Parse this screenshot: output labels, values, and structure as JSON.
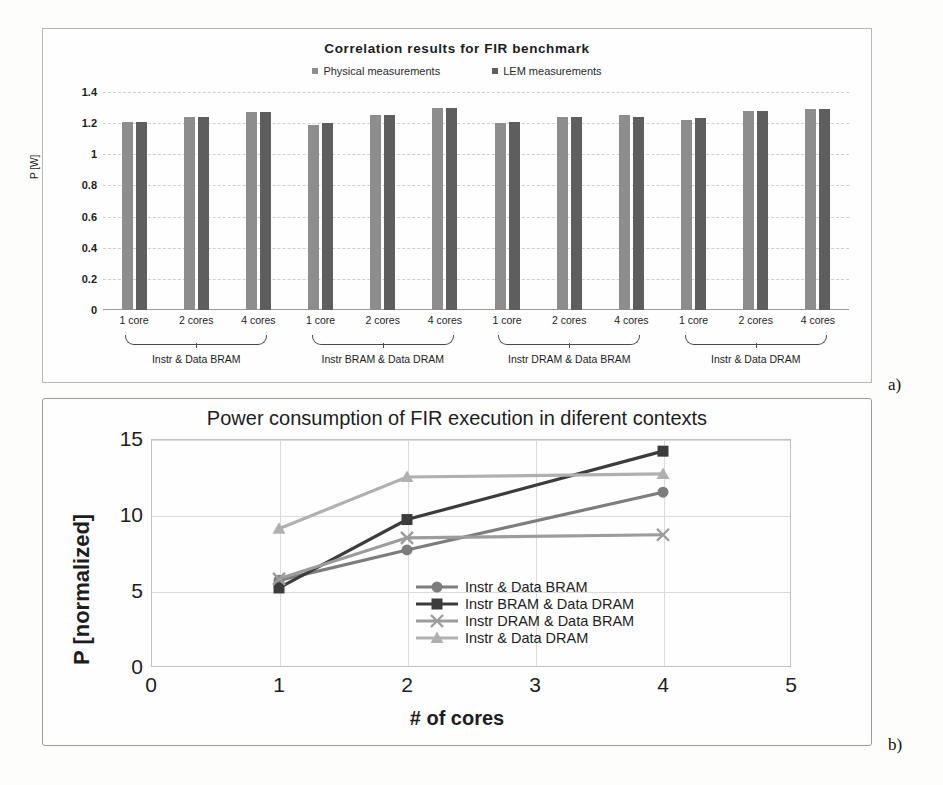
{
  "panel_a": {
    "tag": "a)",
    "chart_data": {
      "type": "bar",
      "title": "Correlation results for FIR benchmark",
      "xlabel": "",
      "ylabel": "P [W]",
      "ylim": [
        0,
        1.4
      ],
      "yticks": [
        "0",
        "0.2",
        "0.4",
        "0.6",
        "0.8",
        "1",
        "1.2",
        "1.4"
      ],
      "grid": true,
      "legend_position": "top-center",
      "legend": [
        {
          "name": "Physical measurements",
          "color": "#8d8d8d"
        },
        {
          "name": "LEM measurements",
          "color": "#5e5e5e"
        }
      ],
      "categories": [
        "1 core",
        "2 cores",
        "4 cores"
      ],
      "groups": [
        {
          "label": "Instr & Data BRAM",
          "clusters": [
            {
              "category": "1 core",
              "values": [
                1.21,
                1.21
              ]
            },
            {
              "category": "2 cores",
              "values": [
                1.24,
                1.24
              ]
            },
            {
              "category": "4 cores",
              "values": [
                1.27,
                1.27
              ]
            }
          ]
        },
        {
          "label": "Instr BRAM & Data DRAM",
          "clusters": [
            {
              "category": "1 core",
              "values": [
                1.19,
                1.2
              ]
            },
            {
              "category": "2 cores",
              "values": [
                1.25,
                1.25
              ]
            },
            {
              "category": "4 cores",
              "values": [
                1.3,
                1.3
              ]
            }
          ]
        },
        {
          "label": "Instr DRAM & Data BRAM",
          "clusters": [
            {
              "category": "1 core",
              "values": [
                1.2,
                1.21
              ]
            },
            {
              "category": "2 cores",
              "values": [
                1.24,
                1.24
              ]
            },
            {
              "category": "4 cores",
              "values": [
                1.25,
                1.24
              ]
            }
          ]
        },
        {
          "label": "Instr & Data DRAM",
          "clusters": [
            {
              "category": "1 core",
              "values": [
                1.22,
                1.23
              ]
            },
            {
              "category": "2 cores",
              "values": [
                1.28,
                1.28
              ]
            },
            {
              "category": "4 cores",
              "values": [
                1.29,
                1.29
              ]
            }
          ]
        }
      ]
    }
  },
  "panel_b": {
    "tag": "b)",
    "chart_data": {
      "type": "line",
      "title": "Power consumption of FIR execution in diferent contexts",
      "xlabel": "# of cores",
      "ylabel": "P [normalized]",
      "xlim": [
        0,
        5
      ],
      "ylim": [
        0,
        15
      ],
      "xticks": [
        "0",
        "1",
        "2",
        "3",
        "4",
        "5"
      ],
      "yticks": [
        "0",
        "5",
        "10",
        "15"
      ],
      "grid": true,
      "legend_position": "inside-right",
      "x": [
        1,
        2,
        4
      ],
      "series": [
        {
          "name": "Instr & Data BRAM",
          "marker": "circle",
          "color": "#7d7d7d",
          "values": [
            5.7,
            7.7,
            11.5
          ]
        },
        {
          "name": "Instr BRAM & Data DRAM",
          "marker": "square",
          "color": "#3c3c3c",
          "values": [
            5.2,
            9.7,
            14.2
          ]
        },
        {
          "name": "Instr DRAM & Data BRAM",
          "marker": "x",
          "color": "#9c9c9c",
          "values": [
            5.8,
            8.5,
            8.7
          ]
        },
        {
          "name": "Instr & Data DRAM",
          "marker": "triangle",
          "color": "#b0b0b0",
          "values": [
            9.1,
            12.5,
            12.7
          ]
        }
      ]
    }
  }
}
